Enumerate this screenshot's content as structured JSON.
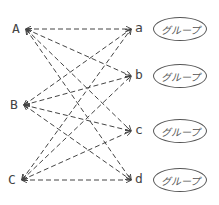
{
  "left_nodes": [
    {
      "label": "A",
      "x": 20,
      "y": 29
    },
    {
      "label": "B",
      "x": 18,
      "y": 105
    },
    {
      "label": "C",
      "x": 16,
      "y": 180
    }
  ],
  "right_nodes": [
    {
      "label": "a",
      "x": 134,
      "y": 29
    },
    {
      "label": "b",
      "x": 134,
      "y": 76
    },
    {
      "label": "c",
      "x": 134,
      "y": 131
    },
    {
      "label": "d",
      "x": 134,
      "y": 180
    }
  ],
  "groups": [
    {
      "label": "グループ",
      "x": 153,
      "y": 17
    },
    {
      "label": "グループ",
      "x": 153,
      "y": 64
    },
    {
      "label": "グループ",
      "x": 153,
      "y": 119
    },
    {
      "label": "グループ",
      "x": 153,
      "y": 168
    }
  ],
  "edge_style": {
    "dash": "5,3",
    "color": "#444444",
    "bidirectional": true
  }
}
